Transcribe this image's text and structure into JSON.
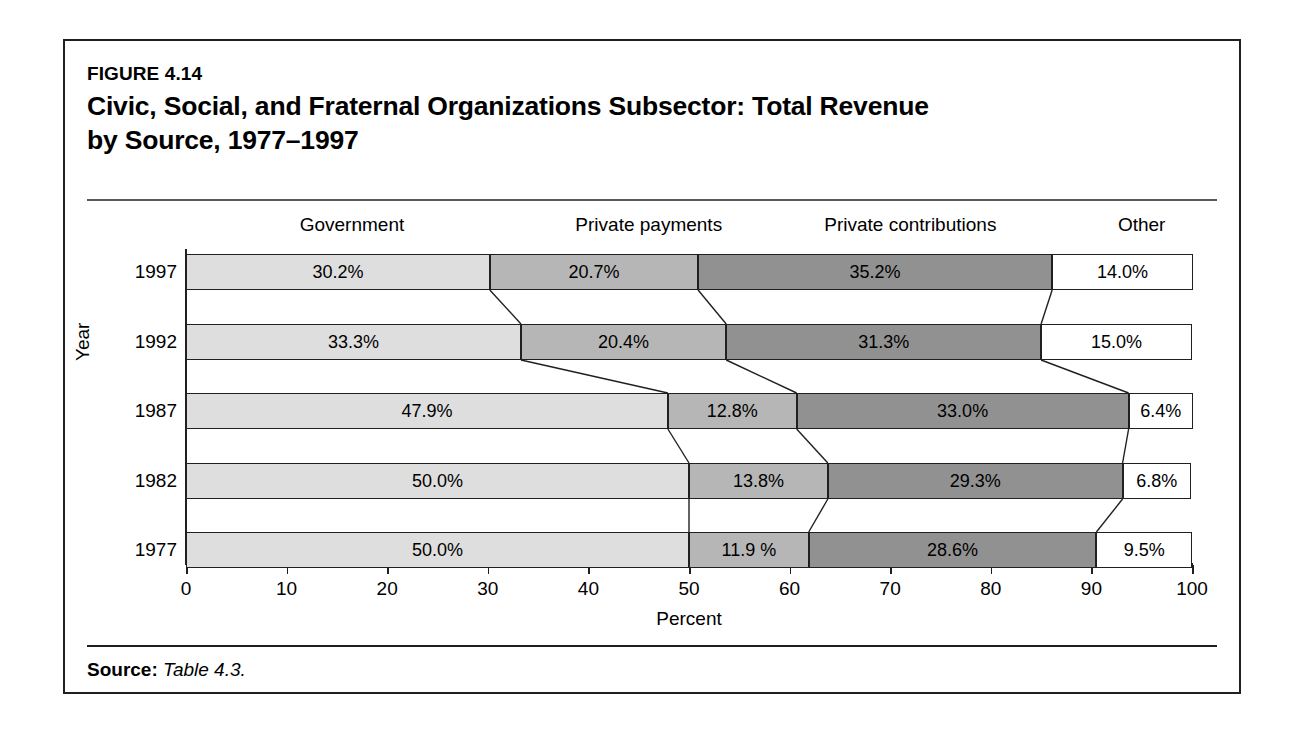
{
  "figure": {
    "number": "FIGURE 4.14",
    "title": "Civic, Social, and Fraternal Organizations Subsector: Total Revenue by Source, 1977–1997",
    "title_line1": "Civic, Social, and Fraternal Organizations Subsector: Total Revenue",
    "title_line2": "by Source, 1977–1997",
    "source_label": "Source:",
    "source_text": "Table 4.3."
  },
  "chart_data": {
    "type": "bar",
    "orientation": "horizontal",
    "stacked": true,
    "stack_mode": "percent",
    "title": "Civic, Social, and Fraternal Organizations Subsector: Total Revenue by Source, 1977–1997",
    "xlabel": "Percent",
    "ylabel": "Year",
    "xlim": [
      0,
      100
    ],
    "xticks": [
      0,
      10,
      20,
      30,
      40,
      50,
      60,
      70,
      80,
      90,
      100
    ],
    "xtick_labels": [
      "0",
      "10",
      "20",
      "30",
      "40",
      "50",
      "60",
      "70",
      "80",
      "90",
      "100"
    ],
    "grid": false,
    "legend": "top-column-headers",
    "categories": [
      "1997",
      "1992",
      "1987",
      "1982",
      "1977"
    ],
    "series": [
      {
        "name": "Government",
        "color": "#dedede",
        "values": [
          30.2,
          33.3,
          47.9,
          50.0,
          50.0
        ],
        "labels": [
          "30.2%",
          "33.3%",
          "47.9%",
          "50.0%",
          "50.0%"
        ]
      },
      {
        "name": "Private payments",
        "color": "#b6b6b6",
        "values": [
          20.7,
          20.4,
          12.8,
          13.8,
          11.9
        ],
        "labels": [
          "20.7%",
          "20.4%",
          "12.8%",
          "13.8%",
          "11.9 %"
        ]
      },
      {
        "name": "Private contributions",
        "color": "#919191",
        "values": [
          35.2,
          31.3,
          33.0,
          29.3,
          28.6
        ],
        "labels": [
          "35.2%",
          "31.3%",
          "33.0%",
          "29.3%",
          "28.6%"
        ]
      },
      {
        "name": "Other",
        "color": "#ffffff",
        "values": [
          14.0,
          15.0,
          6.4,
          6.8,
          9.5
        ],
        "labels": [
          "14.0%",
          "15.0%",
          "6.4%",
          "6.8%",
          "9.5%"
        ]
      }
    ],
    "column_headers": [
      "Government",
      "Private payments",
      "Private contributions",
      "Other"
    ],
    "column_header_positions": [
      16.5,
      46.0,
      72.0,
      95.0
    ]
  }
}
